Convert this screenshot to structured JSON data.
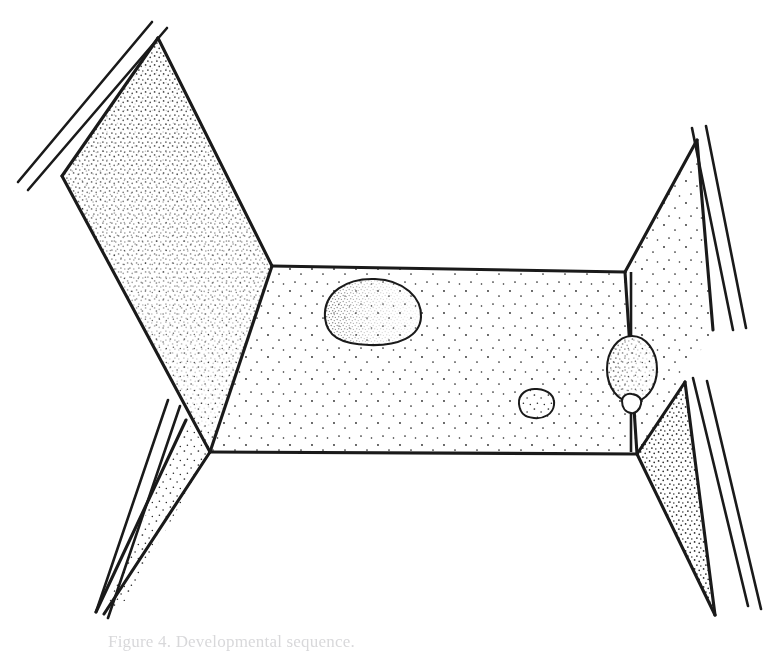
{
  "figure": {
    "caption": "Figure 4. Developmental sequence.",
    "caption_visible": "partially cropped at bottom edge",
    "style": "black-and-white pen-and-ink line drawing with stipple shading",
    "background_color": "#ffffff",
    "ink_color": "#1a1a1a",
    "stipple_color": "#262626",
    "canvas": {
      "width": 767,
      "height": 653
    }
  },
  "geometry": {
    "floor": {
      "name": "central stippled floor panel",
      "points": "272,266 625,272 637,454 210,452",
      "stipple_density": "sparse",
      "fill": "#ffffff"
    },
    "left_panel": {
      "name": "left upper stippled flap",
      "points": "158,38 272,266 210,452 62,176",
      "stipple_density": "dense",
      "fill": "#ffffff"
    },
    "right_panel": {
      "name": "right upper stippled flap",
      "points": "625,272 637,454 713,330 697,140",
      "stipple_density": "sparse",
      "fill": "#ffffff"
    },
    "left_wedge": {
      "name": "left lower narrow stippled wedge",
      "points": "210,452 186,420 104,614",
      "stipple_density": "medium",
      "fill": "#ffffff"
    },
    "right_wedge": {
      "name": "right lower stippled wedge",
      "points": "637,454 685,382 715,615",
      "stipple_density": "dense",
      "fill": "#ffffff"
    }
  },
  "rails": {
    "left_top": {
      "name": "left upper double rail",
      "a": "167,28 28,190",
      "b": "152,22 18,182"
    },
    "right_top": {
      "name": "right upper double rail",
      "a": "692,128 733,330",
      "b": "706,126 746,328"
    },
    "left_bottom": {
      "name": "left lower double rail",
      "a": "168,400 96,612",
      "b": "178,404 106,616"
    },
    "right_bottom": {
      "name": "right lower double rail",
      "a": "693,378 748,606",
      "b": "706,380 760,608"
    }
  },
  "inclusions": [
    {
      "name": "large-oval-inclusion",
      "label": "large ovoid body, upper-left of floor",
      "cx": 371,
      "cy": 310,
      "rx": 50,
      "ry": 31,
      "shading": "dense stipple concentrated along right margin"
    },
    {
      "name": "small-oval-inclusion",
      "label": "small ovoid body, center of floor",
      "cx": 536,
      "cy": 407,
      "rx": 18,
      "ry": 13,
      "shading": "light interior stipple"
    },
    {
      "name": "pendant-oval-inclusion",
      "label": "pendant ovoid body on vertical stalk, right of floor",
      "cx": 632,
      "cy": 369,
      "rx": 25,
      "ry": 33,
      "shading": "stipple denser on right half"
    },
    {
      "name": "bud-inclusion",
      "label": "small bud beneath pendant body",
      "cx": 632,
      "cy": 406,
      "rx": 10,
      "ry": 9,
      "shading": "outline only"
    }
  ],
  "stalk": {
    "name": "vertical-stalk",
    "label": "vertical stalk through pendant body",
    "x": 631,
    "y_top": 272,
    "y_bottom": 452
  }
}
